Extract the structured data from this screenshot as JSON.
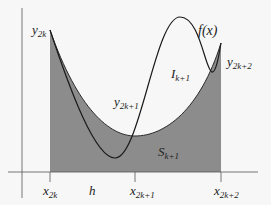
{
  "diagram": {
    "colors": {
      "background": "#f7f7f7",
      "shade": "#8c8c8c",
      "curve": "#1a1a1a",
      "axis": "#555555"
    },
    "labels": {
      "function": "f(x)",
      "y_left": {
        "base": "y",
        "sub": "2k"
      },
      "y_mid": {
        "base": "y",
        "sub": "2k+1"
      },
      "y_right": {
        "base": "y",
        "sub": "2k+2"
      },
      "integral": {
        "base": "I",
        "sub": "k+1"
      },
      "simpson": {
        "base": "S",
        "sub": "k+1"
      },
      "step": "h",
      "x_ticks": [
        {
          "base": "x",
          "sub": "2k"
        },
        {
          "base": "x",
          "sub": "2k+1"
        },
        {
          "base": "x",
          "sub": "2k+2"
        }
      ]
    }
  }
}
